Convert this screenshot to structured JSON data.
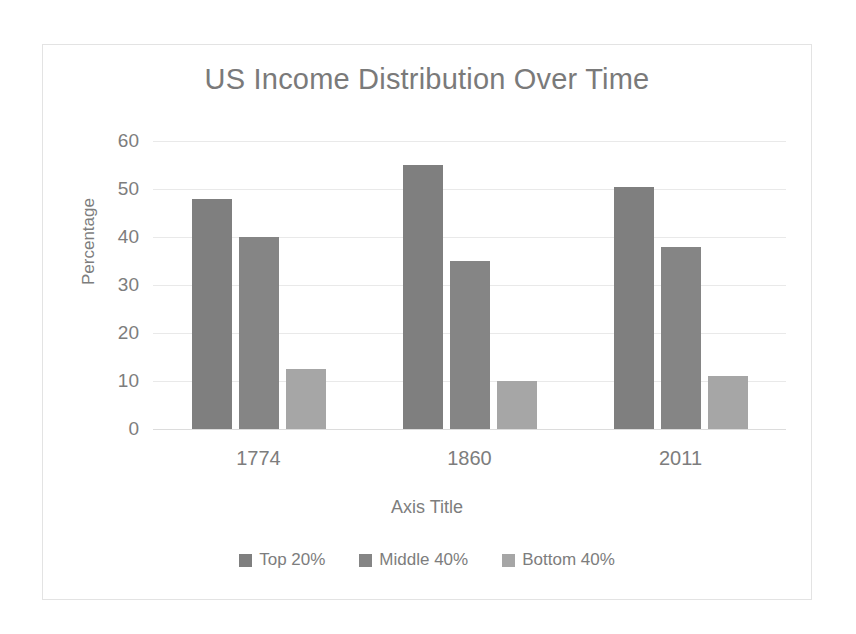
{
  "chart_data": {
    "type": "bar",
    "title": "US Income Distribution Over Time",
    "xlabel": "Axis Title",
    "ylabel": "Percentage",
    "categories": [
      "1774",
      "1860",
      "2011"
    ],
    "series": [
      {
        "name": "Top 20%",
        "values": [
          48,
          55,
          50.5
        ],
        "color": "#7f7f7f"
      },
      {
        "name": "Middle 40%",
        "values": [
          40,
          35,
          38
        ],
        "color": "#858585"
      },
      {
        "name": "Bottom 40%",
        "values": [
          12.5,
          10,
          11
        ],
        "color": "#a6a6a6"
      }
    ],
    "ylim": [
      0,
      60
    ],
    "yticks": [
      "0",
      "10",
      "20",
      "30",
      "40",
      "50",
      "60"
    ],
    "ytick_values": [
      0,
      10,
      20,
      30,
      40,
      50,
      60
    ],
    "grid": true,
    "legend_position": "bottom",
    "plot_background": "#ffffff",
    "gridline_color": "#e9e9e9",
    "text_color": "#7d7d7d",
    "border_color": "#e3e3e3"
  }
}
